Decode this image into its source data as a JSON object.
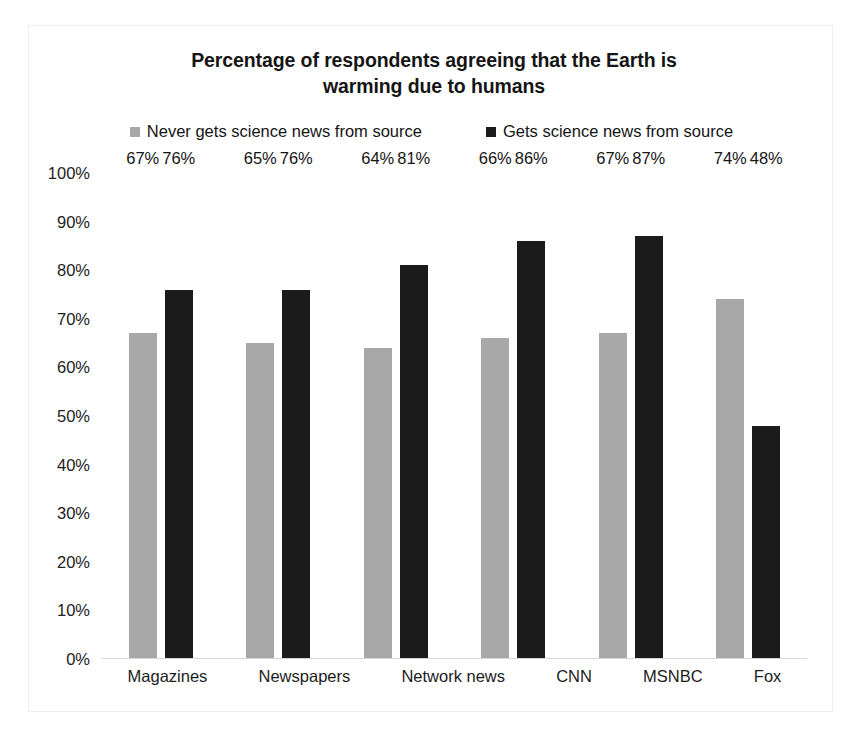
{
  "chart_data": {
    "type": "bar",
    "title": "Percentage of respondents agreeing that the Earth is warming due to humans",
    "title_line1": "Percentage of respondents agreeing that the Earth is",
    "title_line2": "warming due to humans",
    "xlabel": "",
    "ylabel": "",
    "ylim": [
      0,
      100
    ],
    "grid": false,
    "legend_position": "top-center",
    "categories": [
      "Magazines",
      "Newspapers",
      "Network news",
      "CNN",
      "MSNBC",
      "Fox"
    ],
    "y_ticks": [
      "0%",
      "10%",
      "20%",
      "30%",
      "40%",
      "50%",
      "60%",
      "70%",
      "80%",
      "90%",
      "100%"
    ],
    "y_tick_values": [
      0,
      10,
      20,
      30,
      40,
      50,
      60,
      70,
      80,
      90,
      100
    ],
    "series": [
      {
        "name": "Never gets science news from source",
        "color": "#a8a8a8",
        "values": [
          67,
          65,
          64,
          66,
          67,
          74
        ],
        "labels": [
          "67%",
          "65%",
          "64%",
          "66%",
          "67%",
          "74%"
        ]
      },
      {
        "name": "Gets science news from source",
        "color": "#1b1b1b",
        "values": [
          76,
          76,
          81,
          86,
          87,
          48
        ],
        "labels": [
          "76%",
          "76%",
          "81%",
          "86%",
          "87%",
          "48%"
        ]
      }
    ]
  },
  "colors": {
    "series_never": "#a8a8a8",
    "series_gets": "#1b1b1b",
    "text": "#151515",
    "axis_line": "#d6d6d6",
    "frame_border": "#ededed",
    "background": "#ffffff"
  }
}
